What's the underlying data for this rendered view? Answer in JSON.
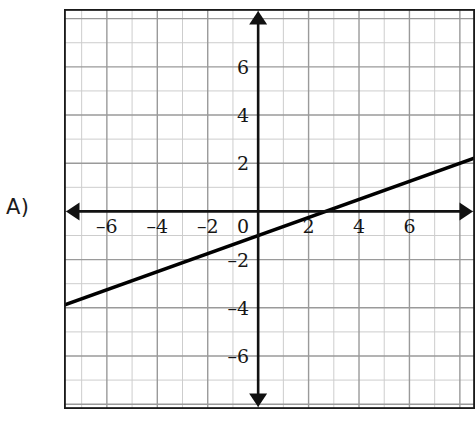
{
  "problem": {
    "label": "A)"
  },
  "chart_data": {
    "type": "line",
    "title": "",
    "xlabel": "",
    "ylabel": "",
    "xlim": [
      -7.7,
      8.6
    ],
    "ylim": [
      -8.2,
      8.4
    ],
    "grid": true,
    "minor_grid": true,
    "grid_step": 1,
    "major_grid_step": 2,
    "legend": "none",
    "axes": {
      "x_axis_arrows": "both",
      "y_axis_arrows": "both",
      "origin_label": "0"
    },
    "xticks": [
      -6,
      -4,
      -2,
      2,
      4,
      6
    ],
    "xtick_labels": [
      "–6",
      "–4",
      "–2",
      "2",
      "4",
      "6"
    ],
    "yticks": [
      6,
      4,
      2,
      -2,
      -4,
      -6
    ],
    "ytick_labels": [
      "6",
      "4",
      "2",
      "–2",
      "–4",
      "–6"
    ],
    "origin_tick_label": "0",
    "series": [
      {
        "name": "line",
        "type": "line",
        "slope": 0.375,
        "y_intercept": -1,
        "x_intercept": 2.67,
        "points": [
          [
            -7.7,
            -3.89
          ],
          [
            8.6,
            2.22
          ]
        ],
        "color": "#000000",
        "line_width": 3
      }
    ],
    "colors": {
      "axis": "#111111",
      "major_grid": "#9a9a9a",
      "minor_grid": "#c9c9c9",
      "border": "#1a1a1a",
      "plot_line": "#000000",
      "background": "#ffffff"
    }
  }
}
